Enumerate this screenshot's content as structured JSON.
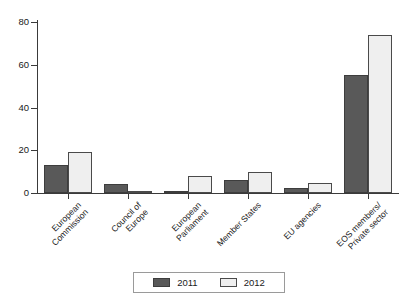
{
  "chart_data": {
    "type": "bar",
    "title": "",
    "subtitle": "",
    "xlabel": "",
    "ylabel": "",
    "ylim": [
      0,
      80
    ],
    "yticks": [
      0,
      20,
      40,
      60,
      80
    ],
    "grid": false,
    "legend_position": "bottom-center",
    "categories": [
      "European\nCommission",
      "Council of\nEurope",
      "European\nParliament",
      "Member States",
      "EU agencies",
      "EOS members/\nPrivate sector"
    ],
    "series": [
      {
        "name": "2011",
        "color": "#595959",
        "values": [
          13,
          4,
          1,
          6,
          2.5,
          55
        ]
      },
      {
        "name": "2012",
        "color": "#efefef",
        "values": [
          19,
          1,
          8,
          10,
          4.5,
          74
        ]
      }
    ]
  },
  "axis": {
    "y_tick_labels": [
      "0",
      "20",
      "40",
      "60",
      "80"
    ]
  },
  "legend": {
    "entries": [
      {
        "label": "2011"
      },
      {
        "label": "2012"
      }
    ]
  }
}
